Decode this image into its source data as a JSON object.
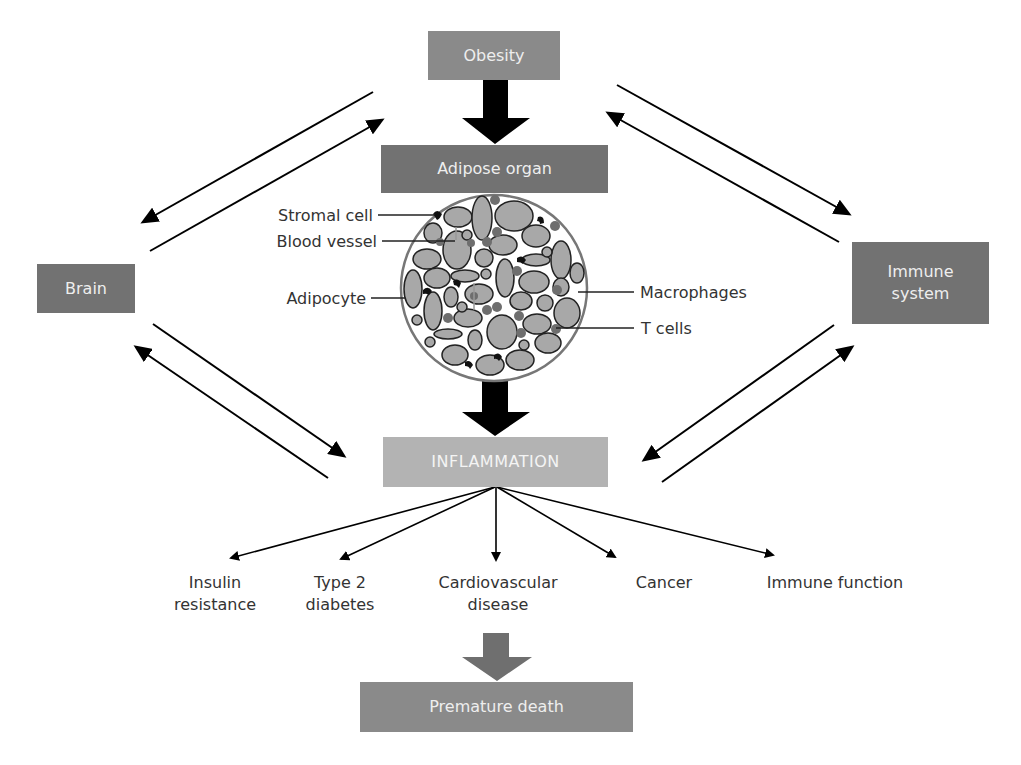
{
  "nodes": {
    "obesity": "Obesity",
    "adipose_organ": "Adipose organ",
    "brain": "Brain",
    "immune_system_line1": "Immune",
    "immune_system_line2": "system",
    "inflammation": "INFLAMMATION",
    "premature_death": "Premature death"
  },
  "cell_labels": {
    "stromal_cell": "Stromal cell",
    "blood_vessel": "Blood vessel",
    "adipocyte": "Adipocyte",
    "macrophages": "Macrophages",
    "t_cells": "T cells"
  },
  "outcomes": [
    {
      "line1": "Insulin",
      "line2": "resistance"
    },
    {
      "line1": "Type 2",
      "line2": "diabetes"
    },
    {
      "line1": "Cardiovascular",
      "line2": "disease"
    },
    {
      "line1": "Cancer",
      "line2": ""
    },
    {
      "line1": "Immune function",
      "line2": ""
    }
  ],
  "colors": {
    "dark_box": "#727272",
    "mid_box": "#8a8a8a",
    "light_box": "#b3b3b3",
    "arrow": "#000000",
    "cell_fill": "#a8a8a8"
  }
}
